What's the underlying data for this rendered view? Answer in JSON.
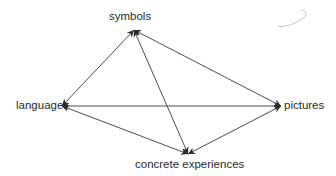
{
  "diagram": {
    "type": "concept-network",
    "nodes": [
      {
        "id": "symbols",
        "label": "symbols",
        "x": 134,
        "y": 30
      },
      {
        "id": "language",
        "label": "language",
        "x": 62,
        "y": 106
      },
      {
        "id": "pictures",
        "label": "pictures",
        "x": 281,
        "y": 106
      },
      {
        "id": "concrete",
        "label": "concrete experiences",
        "x": 188,
        "y": 154
      }
    ],
    "edges": [
      {
        "from": "language",
        "to": "symbols",
        "direction": "both"
      },
      {
        "from": "symbols",
        "to": "pictures",
        "direction": "both"
      },
      {
        "from": "symbols",
        "to": "concrete",
        "direction": "both"
      },
      {
        "from": "language",
        "to": "pictures",
        "direction": "both"
      },
      {
        "from": "language",
        "to": "concrete",
        "direction": "both"
      },
      {
        "from": "concrete",
        "to": "pictures",
        "direction": "both"
      }
    ],
    "colors": {
      "line": "#3a3a3a",
      "text": "#2a2a2a",
      "background": "#ffffff",
      "annotation": "#c8c8c8"
    }
  },
  "labels": {
    "symbols": "symbols",
    "language": "language",
    "pictures": "pictures",
    "concrete": "concrete experiences"
  }
}
